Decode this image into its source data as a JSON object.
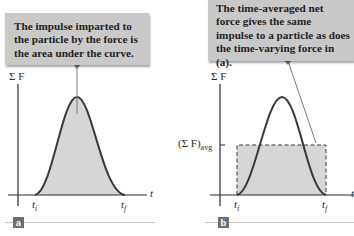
{
  "panels": [
    {
      "id": "a",
      "badge": "a",
      "callout": "The impulse imparted to the particle by the force is the area under the curve.",
      "y_axis_label": "Σ F",
      "x_axis_label": "t",
      "t_start_label": "t",
      "t_start_sub": "i",
      "t_end_label": "t",
      "t_end_sub": "f"
    },
    {
      "id": "b",
      "badge": "b",
      "callout": "The time-averaged net force gives the same impulse to a particle as does the time-varying force in (a).",
      "y_axis_label": "Σ F",
      "x_axis_label": "t",
      "avg_label": "(Σ F)",
      "avg_sub": "avg",
      "t_start_label": "t",
      "t_start_sub": "i",
      "t_end_label": "t",
      "t_end_sub": "f"
    }
  ],
  "colors": {
    "callout_bg": "#c9c9c9",
    "fill": "#d6d6d6",
    "curve": "#3a3a3a",
    "axis": "#2a2a2a",
    "badge": "#6e6e6e",
    "rule": "#c4c4c4"
  }
}
